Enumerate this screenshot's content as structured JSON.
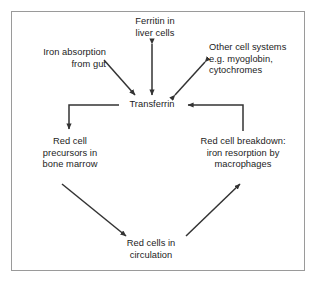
{
  "diagram": {
    "line_color": "#333333",
    "text_color": "#1c1c1c",
    "border_color": "#9a9a9a",
    "background": "#ffffff",
    "nodes": [
      {
        "id": "ferritin",
        "label": "Ferritin in\nliver cells"
      },
      {
        "id": "other",
        "label": "Other cell systems\ne.g. myoglobin,\ncytochromes"
      },
      {
        "id": "iron",
        "label": "Iron absorption\nfrom gut"
      },
      {
        "id": "transferrin",
        "label": "Transferrin"
      },
      {
        "id": "precursors",
        "label": "Red cell\nprecursors in\nbone marrow"
      },
      {
        "id": "breakdown",
        "label": "Red cell breakdown:\niron resorption by\nmacrophages"
      },
      {
        "id": "circulation",
        "label": "Red cells in\ncirculation"
      }
    ],
    "edges": [
      {
        "id": "iron-to-transferrin",
        "from": "iron",
        "to": "transferrin",
        "style": "single-arrow",
        "shape": "diagonal"
      },
      {
        "id": "ferritin-transferrin",
        "from": "ferritin",
        "to": "transferrin",
        "style": "double-arrow",
        "shape": "vertical"
      },
      {
        "id": "other-transferrin",
        "from": "other",
        "to": "transferrin",
        "style": "double-arrow",
        "shape": "diagonal"
      },
      {
        "id": "transferrin-to-precursors",
        "from": "transferrin",
        "to": "precursors",
        "style": "single-arrow",
        "shape": "elbow"
      },
      {
        "id": "precursors-to-circulation",
        "from": "precursors",
        "to": "circulation",
        "style": "single-arrow",
        "shape": "diagonal"
      },
      {
        "id": "circulation-to-breakdown",
        "from": "circulation",
        "to": "breakdown",
        "style": "single-arrow",
        "shape": "diagonal"
      },
      {
        "id": "breakdown-to-transferrin",
        "from": "breakdown",
        "to": "transferrin",
        "style": "single-arrow",
        "shape": "elbow"
      }
    ]
  }
}
